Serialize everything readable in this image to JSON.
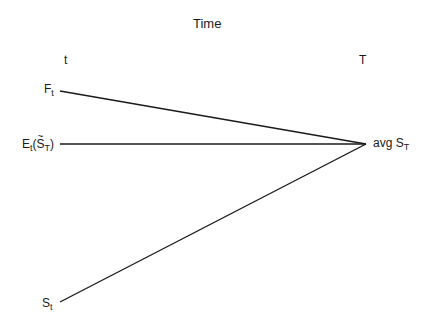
{
  "diagram": {
    "title": "Time",
    "start_label": "t",
    "end_label": "T",
    "nodes": {
      "forward": {
        "base": "F",
        "sub": "t"
      },
      "expectation": {
        "base": "E",
        "sub": "t",
        "arg_base": "S",
        "arg_tilde": "~",
        "arg_sub": "T"
      },
      "spot": {
        "base": "S",
        "sub": "t"
      },
      "target": {
        "prefix": "avg ",
        "base": "S",
        "sub": "T"
      }
    },
    "edges": [
      {
        "from": "forward",
        "to": "target"
      },
      {
        "from": "expectation",
        "to": "target"
      },
      {
        "from": "spot",
        "to": "target"
      }
    ],
    "line_color": "#1a1a1a"
  }
}
